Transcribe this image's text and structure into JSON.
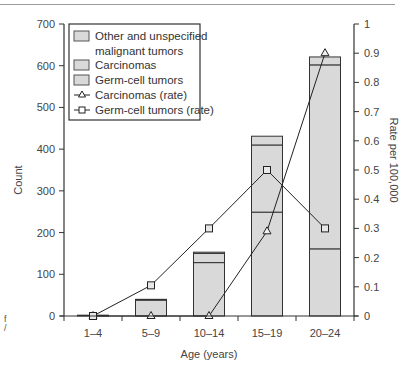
{
  "chart_data": {
    "type": "bar",
    "subtype": "stacked bar with line overlay (dual axis)",
    "title": "",
    "xlabel": "Age (years)",
    "ylabel": "Count",
    "ylabel_right": "Rate per 100,000",
    "categories": [
      "1–4",
      "5–9",
      "10–14",
      "15–19",
      "20–24"
    ],
    "ylim": [
      0,
      700
    ],
    "ylim_right": [
      0,
      1
    ],
    "yticks": [
      0,
      100,
      200,
      300,
      400,
      500,
      600,
      700
    ],
    "yticks_right": [
      0,
      0.1,
      0.2,
      0.3,
      0.4,
      0.5,
      0.6,
      0.7,
      0.8,
      0.9,
      1
    ],
    "grid": false,
    "legend_position": "upper left (inside)",
    "series": [
      {
        "name": "Germ-cell tumors",
        "kind": "bar",
        "axis": "left",
        "values": [
          2,
          38,
          128,
          249,
          161
        ]
      },
      {
        "name": "Carcinomas",
        "kind": "bar",
        "axis": "left",
        "values": [
          0,
          0,
          22,
          161,
          441
        ]
      },
      {
        "name": "Other and unspecified malignant tumors",
        "kind": "bar",
        "axis": "left",
        "values": [
          0,
          2,
          3,
          21,
          19
        ]
      },
      {
        "name": "Carcinomas (rate)",
        "kind": "line",
        "marker": "triangle",
        "axis": "right",
        "values": [
          0,
          0,
          0,
          0.29,
          0.9
        ]
      },
      {
        "name": "Germ-cell tumors (rate)",
        "kind": "line",
        "marker": "square",
        "axis": "right",
        "values": [
          0,
          0.105,
          0.3,
          0.5,
          0.3
        ]
      }
    ],
    "bar_totals": [
      2,
      40,
      153,
      431,
      621
    ]
  },
  "legend": {
    "items": [
      {
        "label_line1": "Other and unspecified",
        "label_line2": "malignant tumors",
        "swatch": "box"
      },
      {
        "label": "Carcinomas",
        "swatch": "box"
      },
      {
        "label": "Germ-cell tumors",
        "swatch": "box"
      },
      {
        "label": "Carcinomas (rate)",
        "swatch": "triangle-line"
      },
      {
        "label": "Germ-cell tumors (rate)",
        "swatch": "square-line"
      }
    ]
  },
  "axes": {
    "left_ticks": [
      "0",
      "100",
      "200",
      "300",
      "400",
      "500",
      "600",
      "700"
    ],
    "right_ticks": [
      "0",
      "0.1",
      "0.2",
      "0.3",
      "0.4",
      "0.5",
      "0.6",
      "0.7",
      "0.8",
      "0.9",
      "1"
    ],
    "x_ticks": [
      "1–4",
      "5–9",
      "10–14",
      "15–19",
      "20–24"
    ],
    "x_title": "Age (years)",
    "y_title": "Count",
    "y2_title": "Rate per 100,000"
  },
  "colors": {
    "bar_fill": "#d9d9d9",
    "bar_stroke": "#333333",
    "line": "#222222",
    "axis": "#333333",
    "text": "#444444"
  },
  "margin_fragment": {
    "line1": "f",
    "line2": "/"
  }
}
